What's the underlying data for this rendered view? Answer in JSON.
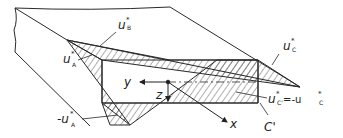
{
  "figure": {
    "colors": {
      "line": "#2a2a2a",
      "hatch": "#3a3a3a",
      "background": "#ffffff"
    }
  },
  "labels": {
    "uB": {
      "main": "u",
      "sup": "*",
      "sub": "B"
    },
    "uA": {
      "main": "u",
      "sup": "*",
      "sub": "A"
    },
    "uC": {
      "main": "u",
      "sup": "*",
      "sub": "C"
    },
    "minus_uA": {
      "main": "-u",
      "sup": "*",
      "sub": "A"
    },
    "uCprime_eq": {
      "main": "u",
      "sup": "*",
      "sub": "C'",
      "rest": " =-u",
      "rest_sup": "*",
      "rest_sub": "C"
    },
    "Cprime": "C'"
  },
  "axes": {
    "y": "y",
    "z": "z",
    "x": "x"
  }
}
